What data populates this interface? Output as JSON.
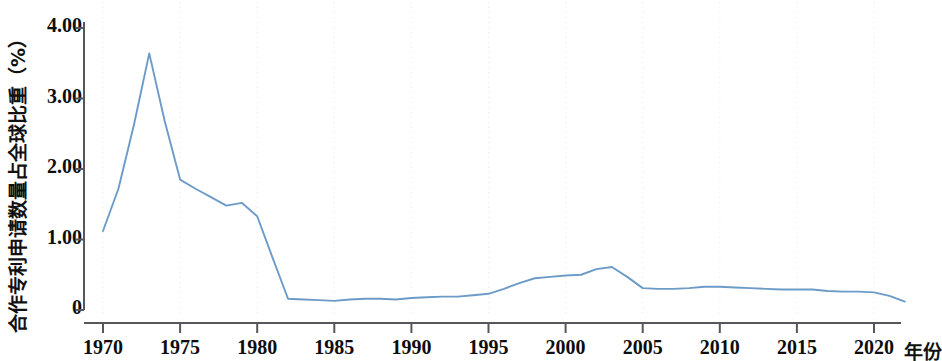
{
  "chart_data": {
    "type": "line",
    "title": "",
    "xlabel": "年份",
    "ylabel": "合作专利申请数量占全球比重（%）",
    "xlim": [
      1970,
      1922
    ],
    "x_axis_range": [
      1969,
      1922
    ],
    "ylim": [
      0,
      4.0
    ],
    "grid": "vertical dotted gridlines at x ticks only",
    "legend": "none",
    "line_color": "#6d9bc8",
    "axis_color": "#4a4a47",
    "x_ticks": [
      "1970",
      "1975",
      "1980",
      "1985",
      "1990",
      "1995",
      "2000",
      "2005",
      "2010",
      "2015",
      "2020"
    ],
    "x_tick_values": [
      1970,
      1975,
      1980,
      1985,
      1990,
      1995,
      2000,
      2005,
      2010,
      2015,
      2020
    ],
    "y_ticks": [
      "0",
      "1.00",
      "2.00",
      "3.00",
      "4.00"
    ],
    "y_tick_values": [
      0,
      1.0,
      2.0,
      3.0,
      4.0
    ],
    "series": [
      {
        "name": "合作专利申请数量占全球比重",
        "x": [
          1970,
          1971,
          1972,
          1973,
          1974,
          1975,
          1976,
          1977,
          1978,
          1979,
          1980,
          1981,
          1982,
          1983,
          1984,
          1985,
          1986,
          1987,
          1988,
          1989,
          1990,
          1991,
          1992,
          1993,
          1994,
          1995,
          1996,
          1997,
          1998,
          1999,
          2000,
          2001,
          2002,
          2003,
          2004,
          2005,
          2006,
          2007,
          2008,
          2009,
          2010,
          2011,
          2012,
          2013,
          2014,
          2015,
          2016,
          2017,
          2018,
          2019,
          2020,
          2021,
          2022
        ],
        "values": [
          1.12,
          1.72,
          2.62,
          3.64,
          2.68,
          1.85,
          1.72,
          1.6,
          1.48,
          1.52,
          1.33,
          0.74,
          0.16,
          0.15,
          0.14,
          0.13,
          0.15,
          0.16,
          0.16,
          0.15,
          0.17,
          0.18,
          0.19,
          0.19,
          0.21,
          0.23,
          0.3,
          0.38,
          0.45,
          0.47,
          0.49,
          0.5,
          0.58,
          0.61,
          0.47,
          0.31,
          0.3,
          0.3,
          0.31,
          0.33,
          0.33,
          0.32,
          0.31,
          0.3,
          0.29,
          0.29,
          0.29,
          0.27,
          0.26,
          0.26,
          0.25,
          0.2,
          0.12
        ]
      }
    ]
  },
  "axis": {
    "y_title": "合作专利申请数量占全球比重（%）",
    "x_title": "年份"
  }
}
